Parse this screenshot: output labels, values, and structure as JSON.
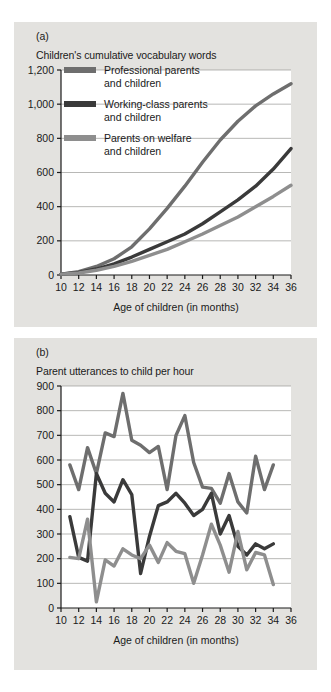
{
  "figure": {
    "background": "#ffffff",
    "panel_background": "#e3e2df",
    "plot_background": "#ffffff",
    "gridline_color": "#9a9a97",
    "axis_color": "#1a1a1a"
  },
  "panels": {
    "a": {
      "letter": "(a)",
      "title": "Children's cumulative vocabulary words",
      "xlabel": "Age of children (in months)"
    },
    "b": {
      "letter": "(b)",
      "title": "Parent utterances to child per hour",
      "xlabel": "Age of children (in months)"
    }
  },
  "series_colors": {
    "professional": "#6e6e6e",
    "working_class": "#3a3a3a",
    "welfare": "#8e8e8e"
  },
  "legend": {
    "items": [
      {
        "key": "professional",
        "line1": "Professional parents",
        "line2": "and children",
        "color": "#6e6e6e"
      },
      {
        "key": "working_class",
        "line1": "Working-class parents",
        "line2": "and children",
        "color": "#3a3a3a"
      },
      {
        "key": "welfare",
        "line1": "Parents on welfare",
        "line2": "and children",
        "color": "#8e8e8e"
      }
    ]
  },
  "chart_data": [
    {
      "id": "chart-a",
      "type": "line",
      "title": "Children's cumulative vocabulary words",
      "xlabel": "Age of children (in months)",
      "ylabel": "",
      "xlim": [
        10,
        36
      ],
      "ylim": [
        0,
        1200
      ],
      "xticks": [
        10,
        12,
        14,
        16,
        18,
        20,
        22,
        24,
        26,
        28,
        30,
        32,
        34,
        36
      ],
      "yticks": [
        0,
        200,
        400,
        600,
        800,
        1000,
        1200
      ],
      "ytick_labels": [
        "0",
        "200",
        "400",
        "600",
        "800",
        "1,000",
        "1,200"
      ],
      "grid": true,
      "legend_position": "inside-top-left",
      "x": [
        10,
        12,
        14,
        16,
        18,
        20,
        22,
        24,
        26,
        28,
        30,
        32,
        34,
        36
      ],
      "series": [
        {
          "name": "Professional parents and children",
          "color": "#6e6e6e",
          "values": [
            5,
            20,
            50,
            95,
            165,
            270,
            390,
            520,
            660,
            790,
            900,
            990,
            1060,
            1120
          ]
        },
        {
          "name": "Working-class parents and children",
          "color": "#3a3a3a",
          "values": [
            5,
            15,
            35,
            65,
            105,
            150,
            195,
            240,
            300,
            370,
            440,
            520,
            620,
            740
          ]
        },
        {
          "name": "Parents on welfare and children",
          "color": "#8e8e8e",
          "values": [
            5,
            12,
            28,
            50,
            80,
            115,
            150,
            195,
            240,
            290,
            340,
            400,
            460,
            525
          ]
        }
      ]
    },
    {
      "id": "chart-b",
      "type": "line",
      "title": "Parent utterances to child per hour",
      "xlabel": "Age of children (in months)",
      "ylabel": "",
      "xlim": [
        10,
        36
      ],
      "ylim": [
        0,
        900
      ],
      "xticks": [
        10,
        12,
        14,
        16,
        18,
        20,
        22,
        24,
        26,
        28,
        30,
        32,
        34,
        36
      ],
      "yticks": [
        0,
        100,
        200,
        300,
        400,
        500,
        600,
        700,
        800,
        900
      ],
      "ytick_labels": [
        "0",
        "100",
        "200",
        "300",
        "400",
        "500",
        "600",
        "700",
        "800",
        "900"
      ],
      "grid": true,
      "legend_position": "none",
      "x": [
        11,
        12,
        13,
        14,
        15,
        16,
        17,
        18,
        19,
        20,
        21,
        22,
        23,
        24,
        25,
        26,
        27,
        28,
        29,
        30,
        31,
        32,
        33,
        34
      ],
      "series": [
        {
          "name": "Professional parents and children",
          "color": "#6e6e6e",
          "values": [
            580,
            480,
            650,
            545,
            710,
            695,
            870,
            680,
            660,
            630,
            655,
            480,
            700,
            780,
            590,
            490,
            485,
            425,
            545,
            430,
            385,
            615,
            480,
            580
          ]
        },
        {
          "name": "Working-class parents and children",
          "color": "#3a3a3a",
          "values": [
            370,
            205,
            190,
            545,
            465,
            430,
            520,
            460,
            140,
            290,
            415,
            430,
            465,
            425,
            375,
            400,
            465,
            300,
            375,
            250,
            215,
            260,
            240,
            260
          ]
        },
        {
          "name": "Parents on welfare and children",
          "color": "#8e8e8e",
          "values": [
            205,
            200,
            360,
            25,
            195,
            170,
            240,
            215,
            200,
            255,
            185,
            265,
            230,
            220,
            100,
            215,
            340,
            255,
            145,
            310,
            155,
            225,
            215,
            95
          ]
        }
      ]
    }
  ]
}
